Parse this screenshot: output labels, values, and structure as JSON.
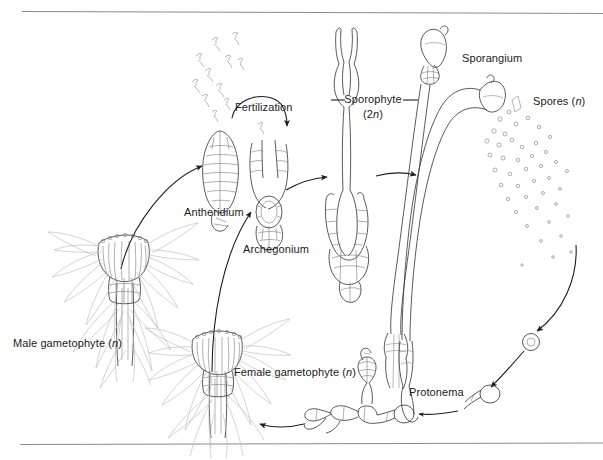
{
  "figure": {
    "width": 603,
    "height": 460,
    "background_color": "#ffffff",
    "ink_color": "#3c3c3c",
    "label_color": "#1a1a1a",
    "rule_color": "#8c8c8c"
  },
  "labels": {
    "fertilization": "Fertilization",
    "sporophyte": "Sporophyte",
    "sporophyte_ploidy_prefix": "(2",
    "sporophyte_ploidy_italic": "n",
    "sporophyte_ploidy_suffix": ")",
    "sporangium": "Sporangium",
    "spores_text": "Spores (",
    "spores_italic": "n",
    "spores_suffix": ")",
    "antheridium": "Antheridium",
    "archegonium": "Archegonium",
    "male_gametophyte_text": "Male gametophyte (",
    "male_gametophyte_italic": "n",
    "male_gametophyte_suffix": ")",
    "female_gametophyte_text": "Female gametophyte (",
    "female_gametophyte_italic": "n",
    "female_gametophyte_suffix": ")",
    "protonema": "Protonema"
  },
  "structures": [
    {
      "name": "sperm-cloud",
      "description": "scattered flagellated sperm cells drifting upward from the antheridium"
    },
    {
      "name": "antheridium",
      "description": "elongate sac of cells that releases sperm"
    },
    {
      "name": "archegonium",
      "description": "flask-shaped gametophyte organ containing the egg"
    },
    {
      "name": "young-sporophyte",
      "description": "embryo sporophyte growing out of the archegonium"
    },
    {
      "name": "mature-sporophyte",
      "description": "seta bearing a capsule (sporangium)"
    },
    {
      "name": "dehiscing-sporophyte",
      "description": "arched sporophyte shedding spores from the open capsule"
    },
    {
      "name": "spore-cloud",
      "description": "cloud of released haploid spores"
    },
    {
      "name": "germinating-spore",
      "description": "single circled spore beginning to germinate"
    },
    {
      "name": "protonema",
      "description": "filamentous protonema with a developing gametophore bud"
    },
    {
      "name": "male-gametophyte",
      "description": "leafy gametophyte with a splash cup of antheridia"
    },
    {
      "name": "female-gametophyte",
      "description": "leafy gametophyte bearing archegonia"
    }
  ],
  "arrows": [
    {
      "name": "arrow-male-to-antheridium",
      "from": "male-gametophyte",
      "to": "antheridium"
    },
    {
      "name": "arrow-female-to-archegonium",
      "from": "female-gametophyte",
      "to": "archegonium"
    },
    {
      "name": "arrow-fertilization",
      "from": "sperm-cloud",
      "to": "archegonium"
    },
    {
      "name": "arrow-archegonium-to-sporophyte",
      "from": "archegonium",
      "to": "young-sporophyte"
    },
    {
      "name": "arrow-sporophyte-to-mature",
      "from": "young-sporophyte",
      "to": "mature-sporophyte"
    },
    {
      "name": "arrow-spores-to-germination",
      "from": "spore-cloud",
      "to": "germinating-spore"
    },
    {
      "name": "arrow-germination-to-protonema",
      "from": "germinating-spore",
      "to": "protonema"
    },
    {
      "name": "arrow-protonema-to-bud",
      "from": "protonema",
      "to": "protonema-bud"
    },
    {
      "name": "arrow-protonema-to-gametophyte",
      "from": "protonema",
      "to": "female-gametophyte"
    }
  ]
}
